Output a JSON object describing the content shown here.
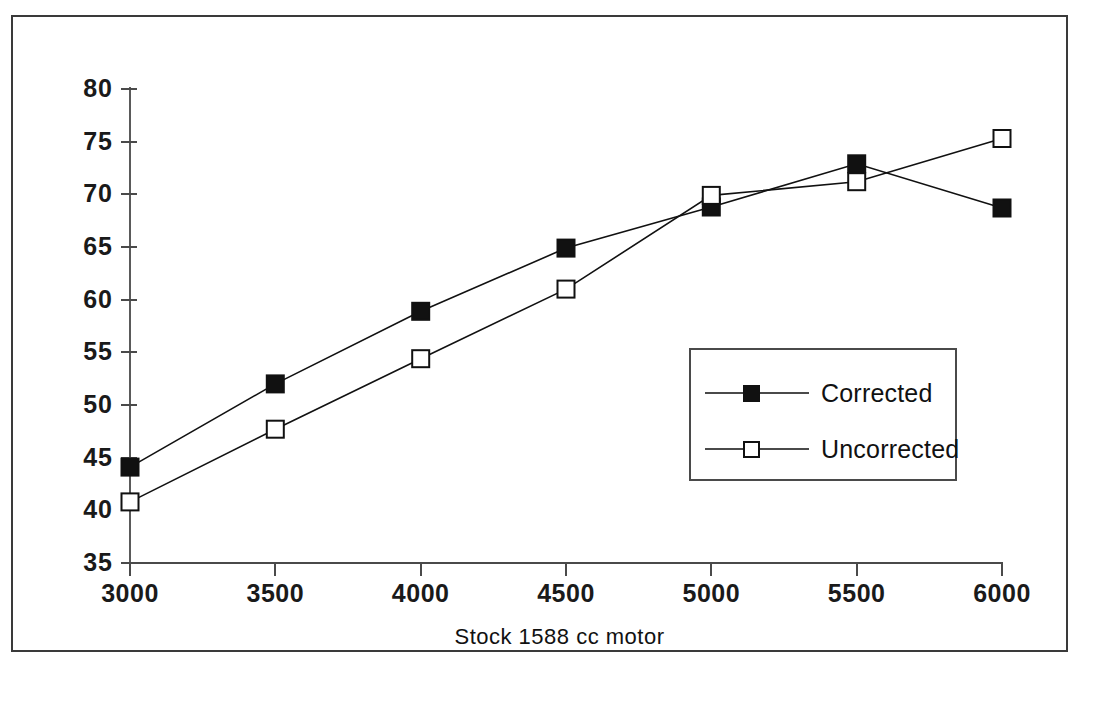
{
  "chart_data": {
    "type": "line",
    "title": "",
    "xlabel": "Stock 1588 cc motor",
    "ylabel": "",
    "x": [
      3000,
      3500,
      4000,
      4500,
      5000,
      5500,
      6000
    ],
    "categories": [
      "3000",
      "3500",
      "4000",
      "4500",
      "5000",
      "5500",
      "6000"
    ],
    "xlim": [
      3000,
      6000
    ],
    "ylim": [
      35,
      80
    ],
    "yticks": [
      80,
      75,
      70,
      65,
      60,
      55,
      50,
      45,
      40,
      35
    ],
    "ytick_labels": [
      "80",
      "75",
      "70",
      "65",
      "60",
      "55",
      "50",
      "45",
      "40",
      "35"
    ],
    "xticks": [
      3000,
      3500,
      4000,
      4500,
      5000,
      5500,
      6000
    ],
    "xtick_labels": [
      "3000",
      "3500",
      "4000",
      "4500",
      "5000",
      "5500",
      "6000"
    ],
    "grid": false,
    "legend_position": "center-right",
    "series": [
      {
        "name": "Corrected",
        "marker": "filled-square",
        "color": "#111111",
        "values": [
          44.1,
          52.0,
          58.9,
          64.9,
          68.8,
          72.9,
          68.7
        ]
      },
      {
        "name": "Uncorrected",
        "marker": "open-square",
        "color": "#111111",
        "values": [
          40.8,
          47.7,
          54.4,
          61.0,
          69.9,
          71.2,
          75.3
        ]
      }
    ]
  },
  "axis": {
    "x_title": "Stock 1588 cc motor"
  },
  "legend": {
    "entries": [
      {
        "label": "Corrected",
        "marker": "filled-square"
      },
      {
        "label": "Uncorrected",
        "marker": "open-square"
      }
    ]
  }
}
